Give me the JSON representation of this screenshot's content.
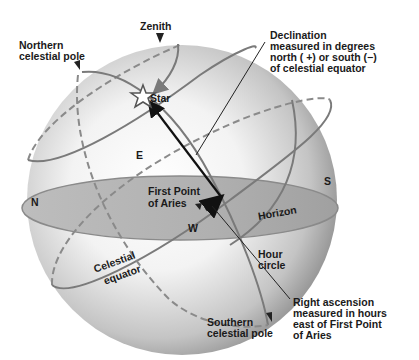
{
  "diagram": {
    "labels": {
      "zenith": "Zenith",
      "northern_pole_line1": "Northern",
      "northern_pole_line2": "celestial pole",
      "star": "Star",
      "declination_line1": "Declination",
      "declination_line2": "measured in degrees",
      "declination_line3": "north ( +) or south (−)",
      "declination_line4": "of celestial equator",
      "east": "E",
      "north": "N",
      "south": "S",
      "west": "W",
      "first_point_line1": "First Point",
      "first_point_line2": "of Aries",
      "horizon": "Horizon",
      "hour_circle_line1": "Hour",
      "hour_circle_line2": "circle",
      "celestial_equator_line1": "Celestial",
      "celestial_equator_line2": "equator",
      "right_ascension_line1": "Right ascension",
      "right_ascension_line2": "measured in hours",
      "right_ascension_line3": "east of First Point",
      "right_ascension_line4": "of Aries",
      "southern_pole_line1": "Southern",
      "southern_pole_line2": "celestial pole"
    },
    "colors": {
      "sphere_light": "#ffffff",
      "sphere_dark": "#8c8c8c",
      "horizon_plane": "#b5b5b5",
      "circle_line": "#7a7a7a",
      "arrow": "#111111"
    }
  }
}
